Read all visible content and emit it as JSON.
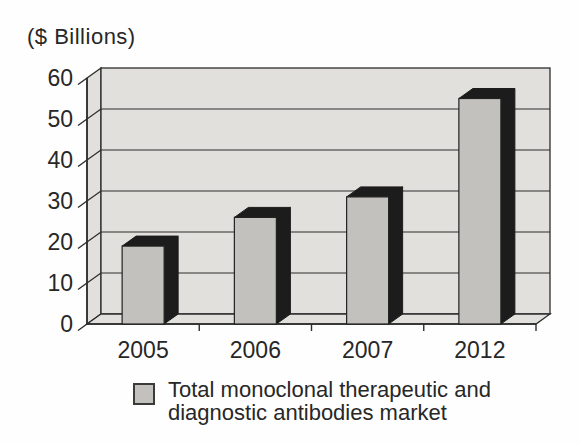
{
  "colors": {
    "background": "#fefefe",
    "wall": "#e2e0dc",
    "bar_front": "#c3c1be",
    "bar_dark": "#1c1c1c",
    "line": "#2d2d2d",
    "text": "#272727"
  },
  "legend": {
    "lines": [
      "Total monoclonal therapeutic and",
      "diagnostic antibodies market"
    ]
  },
  "chart_data": {
    "type": "bar",
    "style": "3d",
    "categories": [
      "2005",
      "2006",
      "2007",
      "2012"
    ],
    "values": [
      19,
      26,
      31,
      55
    ],
    "series_label": "Total monoclonal therapeutic and diagnostic antibodies market",
    "title": "",
    "xlabel": "",
    "ylabel": "($ Billions)",
    "ylim": [
      0,
      60
    ],
    "yticks": [
      0,
      10,
      20,
      30,
      40,
      50,
      60
    ],
    "grid": true,
    "legend_position": "bottom"
  }
}
